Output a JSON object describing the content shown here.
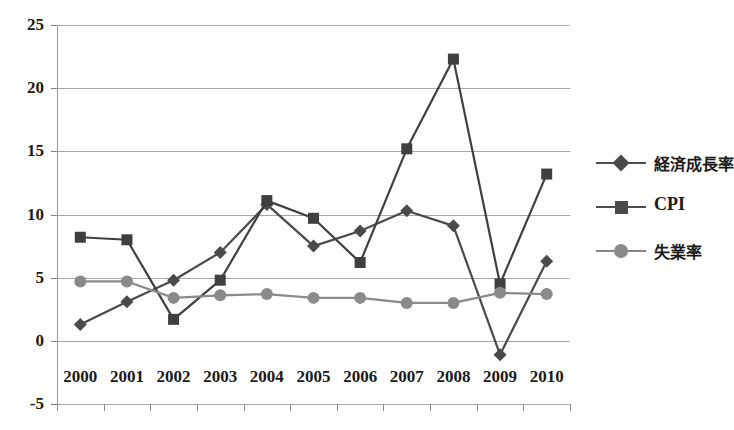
{
  "chart_data": {
    "type": "line",
    "title": "",
    "xlabel": "",
    "ylabel": "",
    "categories": [
      "2000",
      "2001",
      "2002",
      "2003",
      "2004",
      "2005",
      "2006",
      "2007",
      "2008",
      "2009",
      "2010"
    ],
    "ylim": [
      -5,
      25
    ],
    "yticks": [
      25,
      20,
      15,
      10,
      5,
      0,
      -5
    ],
    "ytick_labels": [
      "25",
      "20",
      "15",
      "10",
      "5",
      "0",
      "-5"
    ],
    "grid": true,
    "legend_position": "right",
    "series": [
      {
        "name": "経済成長率",
        "marker": "diamond",
        "color": "#4a4a4a",
        "values": [
          1.3,
          3.1,
          4.8,
          7.0,
          10.8,
          7.5,
          8.7,
          10.3,
          9.1,
          -1.1,
          6.3
        ]
      },
      {
        "name": "CPI",
        "marker": "square",
        "color": "#3f3f3f",
        "values": [
          8.2,
          8.0,
          1.7,
          4.8,
          11.1,
          9.7,
          6.2,
          15.2,
          22.3,
          4.5,
          13.2
        ]
      },
      {
        "name": "失業率",
        "marker": "circle",
        "color": "#8a8a8a",
        "values": [
          4.7,
          4.7,
          3.4,
          3.6,
          3.7,
          3.4,
          3.4,
          3.0,
          3.0,
          3.8,
          3.7
        ]
      }
    ]
  },
  "legend": {
    "items": [
      {
        "label": "経済成長率",
        "glyph": "diamond-marker-icon"
      },
      {
        "label": "CPI",
        "glyph": "square-marker-icon"
      },
      {
        "label": "失業率",
        "glyph": "circle-marker-icon"
      }
    ]
  },
  "colors": {
    "grid": "#a6a6a6",
    "axis": "#7a7a7a",
    "series_dark": "#4a4a4a",
    "series_light": "#8a8a8a",
    "text": "#1a1a1a",
    "background": "#ffffff"
  }
}
